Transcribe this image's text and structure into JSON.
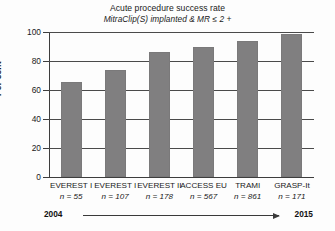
{
  "chart_data": {
    "type": "bar",
    "title": "Acute procedure success rate",
    "subtitle": "MitraClip(S) implanted & MR ≤ 2 +",
    "xlabel": "",
    "ylabel": "Per cent",
    "ylim": [
      0,
      100
    ],
    "yticks": [
      0,
      20,
      40,
      60,
      80,
      100
    ],
    "ytick_labels": [
      "0",
      "20",
      "40",
      "60",
      "80",
      "100"
    ],
    "grid": true,
    "legend": false,
    "bar_color": "#807f80",
    "categories": [
      "EVEREST I",
      "EVEREST I",
      "EVEREST II",
      "ACCESS EU",
      "TRAMI",
      "GRASP-It"
    ],
    "category_sublabels": [
      "n = 55",
      "n = 107",
      "n = 178",
      "n = 567",
      "n = 861",
      "n = 171"
    ],
    "sample_sizes": [
      55,
      107,
      178,
      567,
      861,
      171
    ],
    "values": [
      65.5,
      74,
      86,
      90,
      94,
      98.5
    ],
    "annotations": {
      "timeline_start": "2004",
      "timeline_end": "2015"
    }
  },
  "axis": {
    "y_title": "Per cent"
  }
}
